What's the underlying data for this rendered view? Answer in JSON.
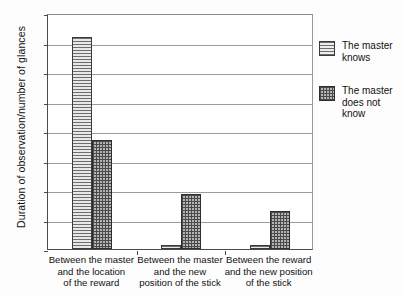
{
  "chart_data": {
    "type": "bar",
    "title": "",
    "xlabel": "",
    "ylabel": "Duration of observation/number of glances",
    "ylim": [
      0,
      16
    ],
    "ytick_step": 2,
    "yticks": [
      0,
      2,
      4,
      6,
      8,
      10,
      12,
      14,
      16
    ],
    "grid": "horizontal",
    "legend_position": "right-outside",
    "categories": [
      "Between the master\nand the location\nof the reward",
      "Between the master\nand the new\nposition of the stick",
      "Between the reward\nand the new position\nof the stick"
    ],
    "category_lines": [
      [
        "Between the master",
        "and the location",
        "of the reward"
      ],
      [
        "Between the master",
        "and the new",
        "position of the stick"
      ],
      [
        "Between the reward",
        "and the new position",
        "of the stick"
      ]
    ],
    "series": [
      {
        "name": "The master knows",
        "name_lines": [
          "The master",
          "knows"
        ],
        "pattern": "horizontal-lines",
        "color": "#d2d2d2",
        "values": [
          14.4,
          0.25,
          0.3
        ]
      },
      {
        "name": "The master does not know",
        "name_lines": [
          "The master",
          "does not know"
        ],
        "pattern": "crosshatch",
        "color": "#b4b4b4",
        "values": [
          7.4,
          3.75,
          2.6
        ]
      }
    ]
  },
  "axis": {
    "y_title": "Duration of observation/number of glances",
    "y_tick_labels": [
      "0",
      "2",
      "4",
      "6",
      "8",
      "10",
      "12",
      "14",
      "16"
    ]
  },
  "legend": {
    "entries": [
      {
        "line1": "The master",
        "line2": "knows"
      },
      {
        "line1": "The master",
        "line2": "does not know"
      }
    ]
  }
}
